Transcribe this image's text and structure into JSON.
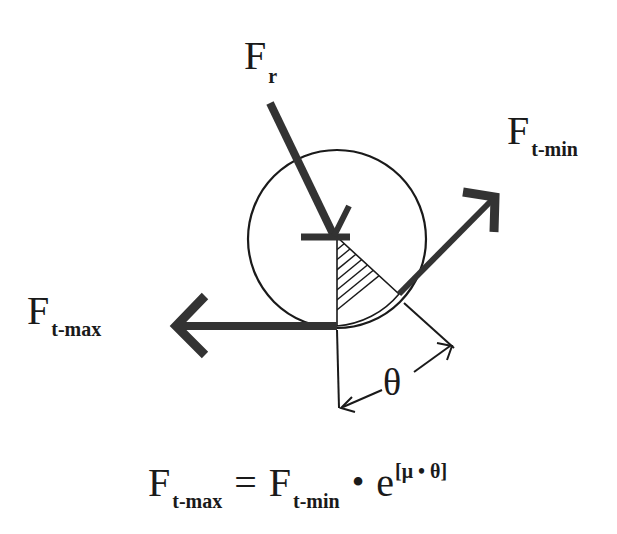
{
  "diagram": {
    "type": "belt-friction (capstan) free-body diagram",
    "labels": {
      "radial_force": {
        "symbol": "F",
        "subscript": "r"
      },
      "tension_min": {
        "symbol": "F",
        "subscript": "t-min"
      },
      "tension_max": {
        "symbol": "F",
        "subscript": "t-max"
      },
      "wrap_angle": "θ"
    },
    "colors": {
      "ink": "#1a1a1a",
      "arrow_fill": "#333333",
      "background": "#ffffff"
    }
  },
  "formula": {
    "lhs_symbol": "F",
    "lhs_subscript": "t-max",
    "equals": "=",
    "rhs_symbol": "F",
    "rhs_subscript": "t-min",
    "multiply": "•",
    "exp_base": "e",
    "exponent": "[μ • θ]"
  }
}
